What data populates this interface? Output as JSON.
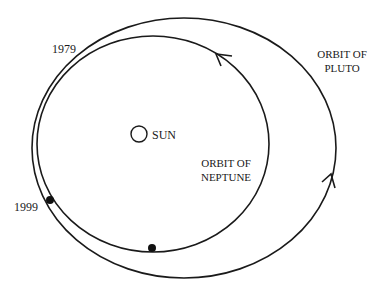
{
  "diagram": {
    "title": "",
    "labels": {
      "year_1979": "1979",
      "year_1999": "1999",
      "sun": "SUN",
      "pluto_orbit_line1": "ORBIT OF",
      "pluto_orbit_line2": "PLUTO",
      "neptune_orbit_line1": "ORBIT OF",
      "neptune_orbit_line2": "NEPTUNE"
    },
    "colors": {
      "stroke": "#1a1a1a",
      "background": "#ffffff"
    },
    "shapes": {
      "pluto_orbit": {
        "cx": 184,
        "cy": 148,
        "rx": 152,
        "ry": 130
      },
      "neptune_orbit": {
        "cx": 153,
        "cy": 144,
        "rx": 116,
        "ry": 108
      },
      "sun": {
        "cx": 139,
        "cy": 134,
        "r": 8
      },
      "markers": [
        {
          "name": "1999-position",
          "cx": 50,
          "cy": 200
        },
        {
          "name": "neptune-position",
          "cx": 152,
          "cy": 248
        }
      ],
      "arrows": [
        {
          "name": "neptune-direction",
          "x": 217,
          "y": 55
        },
        {
          "name": "pluto-direction",
          "x": 331,
          "y": 175
        }
      ]
    }
  }
}
